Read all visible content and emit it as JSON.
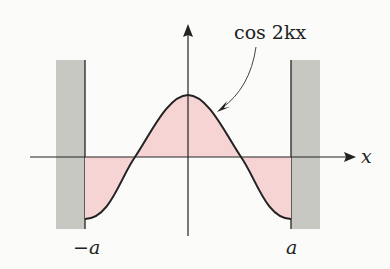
{
  "diagram": {
    "title": "",
    "curve_label": "cos 2kx",
    "axis_label_x": "x",
    "left_wall_label": "−a",
    "right_wall_label": "a",
    "colors": {
      "wall": "#c8c8c2",
      "fill": "#f6d4d4",
      "line": "#222222",
      "background": "#fbfbf9"
    }
  }
}
